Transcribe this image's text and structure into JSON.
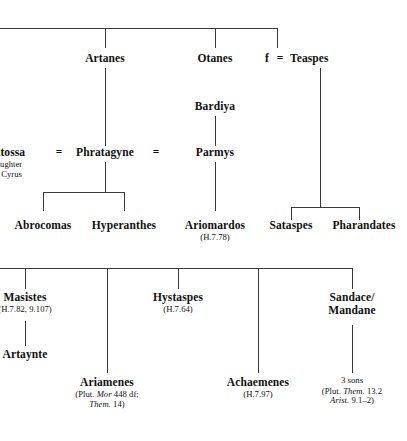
{
  "figure": {
    "type": "genealogical-stemma"
  },
  "nodes": {
    "artanes": {
      "name": "Artanes"
    },
    "otanes": {
      "name": "Otanes"
    },
    "teaspes": {
      "name": "Teaspes",
      "spouse_marker": "f",
      "equals": "="
    },
    "bardiya": {
      "name": "Bardiya"
    },
    "atossa": {
      "name": "Atossa",
      "sub_line1": "daughter",
      "sub_line2": "of Cyrus",
      "equals": "="
    },
    "phratagyne": {
      "name": "Phratagyne",
      "equals": "="
    },
    "parmys": {
      "name": "Parmys"
    },
    "abrocomas": {
      "name": "Abrocomas"
    },
    "hyperanthes": {
      "name": "Hyperanthes"
    },
    "ariomardos": {
      "name": "Ariomardos",
      "cite": "(H.7.78)"
    },
    "sataspes": {
      "name": "Sataspes"
    },
    "pharandates": {
      "name": "Pharandates"
    },
    "masistes": {
      "name": "Masistes",
      "cite": "(H.7.82, 9.107)"
    },
    "artaynte": {
      "name": "Artaynte"
    },
    "hystaspes": {
      "name": "Hystaspes",
      "cite": "(H.7.64)"
    },
    "sandace": {
      "name_line1": "Sandace/",
      "name_line2": "Mandane"
    },
    "ariamenes": {
      "name": "Ariamenes",
      "cite_pre": "(Plut. ",
      "cite_it1": "Mor",
      "cite_mid": " 448 df;",
      "cite_it2": "Them.",
      "cite_post": " 14)"
    },
    "achaemenes": {
      "name": "Achaemenes",
      "cite": "(H.7.97)"
    },
    "three_sons": {
      "label": "3 sons",
      "cite_pre": "(Plut. ",
      "cite_it1": "Them.",
      "cite_mid": " 13.2",
      "cite_it2": "Arist.",
      "cite_post": " 9.1–2)"
    }
  },
  "colors": {
    "line": "#3a3a3a",
    "text": "#111111",
    "background": "#ffffff"
  }
}
